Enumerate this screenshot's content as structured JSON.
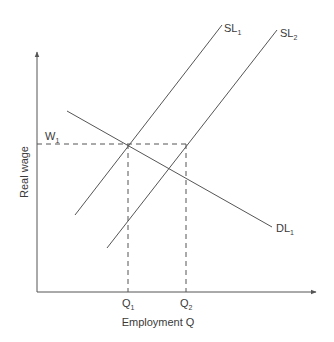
{
  "diagram": {
    "type": "labor-market supply-demand",
    "axes": {
      "x_title": "Employment Q",
      "y_title": "Real wage"
    },
    "curves": {
      "sl1": {
        "main": "SL",
        "sub": "1"
      },
      "sl2": {
        "main": "SL",
        "sub": "2"
      },
      "dl1": {
        "main": "DL",
        "sub": "1"
      }
    },
    "markers": {
      "w1": {
        "main": "W",
        "sub": "1"
      },
      "q1": {
        "main": "Q",
        "sub": "1"
      },
      "q2": {
        "main": "Q",
        "sub": "2"
      }
    },
    "colors": {
      "line": "#555555",
      "text": "#3a3a3a",
      "background": "#ffffff"
    }
  }
}
